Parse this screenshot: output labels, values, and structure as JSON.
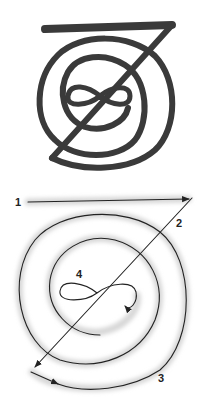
{
  "figure": {
    "top_panel": {
      "description": "Cho Ku Rei style symbol drawn in thick marker strokes: horizontal bar, diagonal, spiral of two rings with figure-eight center",
      "stroke_color": "#3a3a3a"
    },
    "bottom_panel": {
      "description": "Stroke order diagram with numbered steps and arrows",
      "stroke_color": "#2a2a2a",
      "halo_color": "#d8d8d8",
      "steps": [
        {
          "label": "1",
          "meaning": "horizontal stroke left to right"
        },
        {
          "label": "2",
          "meaning": "diagonal stroke from top right down to bottom left"
        },
        {
          "label": "3",
          "meaning": "spiral counter-clockwise inward"
        },
        {
          "label": "4",
          "meaning": "figure-eight at center"
        }
      ]
    }
  }
}
